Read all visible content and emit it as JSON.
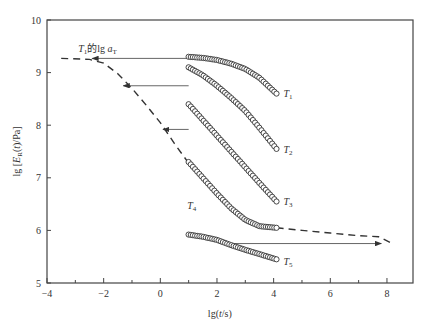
{
  "chart_data": {
    "type": "scatter",
    "title": "",
    "xlabel": "lg(t/s)",
    "ylabel": "lg [E_R(t)/Pa]",
    "xlim": [
      -4,
      9
    ],
    "ylim": [
      5,
      10
    ],
    "xticks": [
      -4,
      -2,
      0,
      2,
      4,
      6,
      8
    ],
    "yticks": [
      5,
      6,
      7,
      8,
      9,
      10
    ],
    "grid": false,
    "annotation": "T1的lg aT",
    "series": [
      {
        "name": "T1",
        "x_range": [
          1.0,
          4.1
        ],
        "points": [
          [
            1.0,
            9.3
          ],
          [
            1.5,
            9.28
          ],
          [
            2.0,
            9.24
          ],
          [
            2.5,
            9.17
          ],
          [
            3.0,
            9.07
          ],
          [
            3.5,
            8.9
          ],
          [
            4.1,
            8.6
          ]
        ]
      },
      {
        "name": "T2",
        "x_range": [
          1.0,
          4.1
        ],
        "points": [
          [
            1.0,
            9.1
          ],
          [
            1.5,
            8.95
          ],
          [
            2.0,
            8.75
          ],
          [
            2.5,
            8.52
          ],
          [
            3.0,
            8.27
          ],
          [
            3.5,
            7.95
          ],
          [
            4.1,
            7.55
          ]
        ]
      },
      {
        "name": "T3",
        "x_range": [
          1.0,
          4.1
        ],
        "points": [
          [
            1.0,
            8.4
          ],
          [
            1.5,
            8.1
          ],
          [
            2.0,
            7.8
          ],
          [
            2.5,
            7.5
          ],
          [
            3.0,
            7.2
          ],
          [
            3.5,
            6.9
          ],
          [
            4.1,
            6.55
          ]
        ]
      },
      {
        "name": "T4",
        "x_range": [
          1.0,
          4.1
        ],
        "points": [
          [
            1.0,
            7.3
          ],
          [
            1.5,
            7.0
          ],
          [
            2.0,
            6.7
          ],
          [
            2.5,
            6.42
          ],
          [
            3.0,
            6.2
          ],
          [
            3.5,
            6.08
          ],
          [
            4.1,
            6.05
          ]
        ]
      },
      {
        "name": "T5",
        "x_range": [
          1.0,
          4.1
        ],
        "points": [
          [
            1.0,
            5.92
          ],
          [
            1.5,
            5.88
          ],
          [
            2.0,
            5.82
          ],
          [
            2.5,
            5.72
          ],
          [
            3.0,
            5.63
          ],
          [
            3.5,
            5.55
          ],
          [
            4.1,
            5.45
          ]
        ]
      }
    ],
    "master_curve": {
      "style": "dashed",
      "points": [
        [
          -3.5,
          9.27
        ],
        [
          -2.5,
          9.25
        ],
        [
          -2.0,
          9.18
        ],
        [
          -1.5,
          8.98
        ],
        [
          -1.0,
          8.7
        ],
        [
          -0.5,
          8.38
        ],
        [
          0.0,
          8.05
        ],
        [
          0.5,
          7.65
        ],
        [
          1.0,
          7.28
        ],
        [
          1.5,
          7.0
        ],
        [
          2.0,
          6.7
        ],
        [
          2.5,
          6.42
        ],
        [
          3.0,
          6.2
        ],
        [
          3.5,
          6.08
        ],
        [
          4.1,
          6.05
        ],
        [
          5.0,
          6.0
        ],
        [
          6.0,
          5.95
        ],
        [
          7.0,
          5.9
        ],
        [
          7.7,
          5.88
        ],
        [
          8.2,
          5.75
        ]
      ]
    },
    "shift_arrows": [
      {
        "from": [
          1.0,
          9.27
        ],
        "to": [
          -2.4,
          9.27
        ],
        "direction": "left"
      },
      {
        "from": [
          1.0,
          8.75
        ],
        "to": [
          -1.3,
          8.75
        ],
        "direction": "left"
      },
      {
        "from": [
          1.0,
          7.92
        ],
        "to": [
          0.1,
          7.92
        ],
        "direction": "left"
      },
      {
        "from": [
          2.3,
          5.75
        ],
        "to": [
          7.8,
          5.75
        ],
        "direction": "right"
      }
    ]
  },
  "labels": {
    "t1": "T",
    "t1_sub": "1",
    "t2": "T",
    "t2_sub": "2",
    "t3": "T",
    "t3_sub": "3",
    "t4": "T",
    "t4_sub": "4",
    "t5": "T",
    "t5_sub": "5",
    "annotation_T": "T",
    "annotation_sub": "1",
    "annotation_mid": "的lg ",
    "annotation_a": "a",
    "annotation_a_sub": "T",
    "xlabel": "lg(t/s)",
    "ylabel": "lg [E_R(t)/Pa]"
  }
}
